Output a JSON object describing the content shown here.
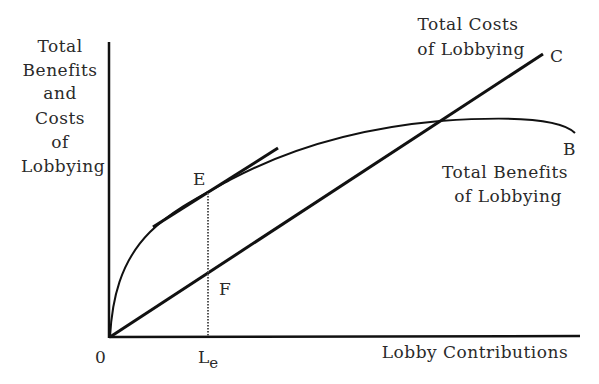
{
  "diagram": {
    "y_axis_label": [
      "Total",
      "Benefits",
      "and",
      "Costs",
      "of",
      "Lobbying"
    ],
    "x_axis_label": "Lobby Contributions",
    "origin_label": "0",
    "le_label": "L",
    "le_subscript": "e",
    "costs_label": [
      "Total Costs",
      "of Lobbying"
    ],
    "benefits_label": [
      "Total Benefits",
      "of Lobbying"
    ],
    "point_c": "C",
    "point_b": "B",
    "point_e": "E",
    "point_f": "F",
    "colors": {
      "line": "#111111",
      "text": "#2a2a2a",
      "background": "#ffffff"
    }
  }
}
